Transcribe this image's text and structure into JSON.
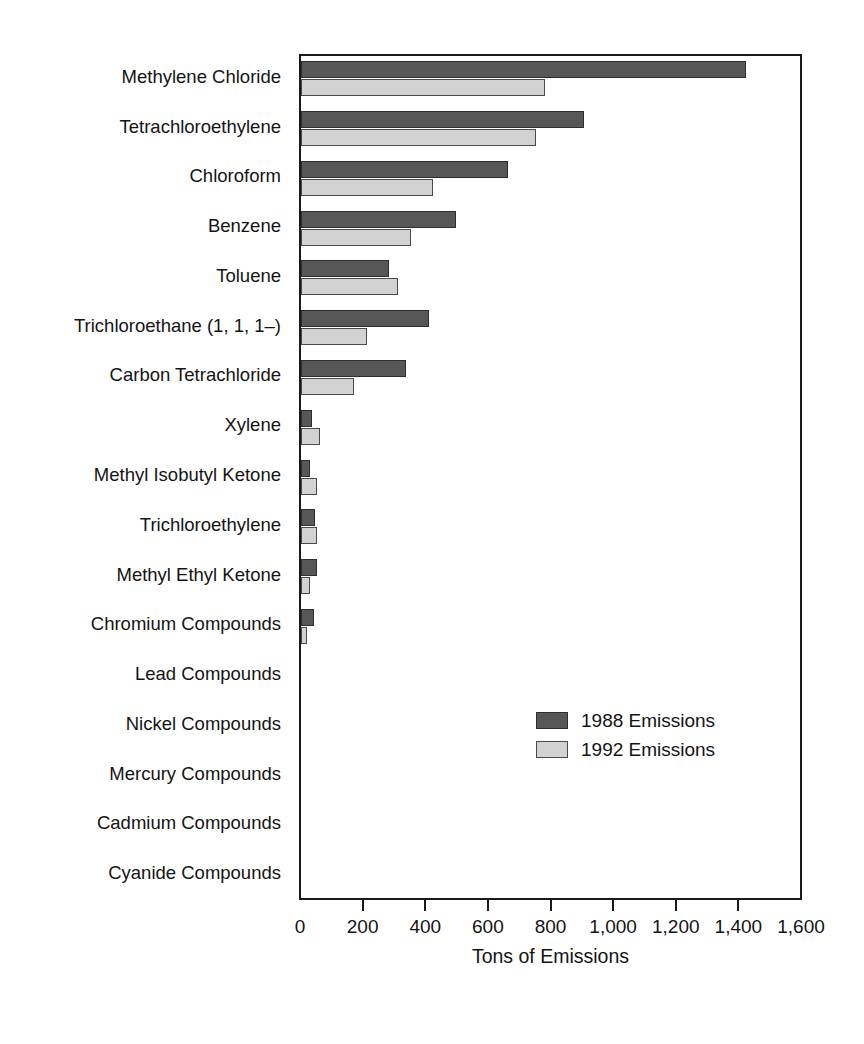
{
  "chart_data": {
    "type": "bar",
    "orientation": "horizontal",
    "title": "",
    "xlabel": "Tons of Emissions",
    "ylabel": "",
    "xlim": [
      0,
      1600
    ],
    "xticks": [
      0,
      200,
      400,
      600,
      800,
      1000,
      1200,
      1400,
      1600
    ],
    "xticklabels": [
      "0",
      "200",
      "400",
      "600",
      "800",
      "1,000",
      "1,200",
      "1,400",
      "1,600"
    ],
    "grid": false,
    "legend_position": "inside-lower-right",
    "categories": [
      "Methylene Chloride",
      "Tetrachloroethylene",
      "Chloroform",
      "Benzene",
      "Toluene",
      "Trichloroethane (1, 1, 1–)",
      "Carbon Tetrachloride",
      "Xylene",
      "Methyl Isobutyl Ketone",
      "Trichloroethylene",
      "Methyl Ethyl Ketone",
      "Chromium Compounds",
      "Lead Compounds",
      "Nickel Compounds",
      "Mercury Compounds",
      "Cadmium Compounds",
      "Cyanide Compounds"
    ],
    "series": [
      {
        "name": "1988 Emissions",
        "color": "#575757",
        "values": [
          1420,
          905,
          660,
          495,
          280,
          410,
          335,
          35,
          30,
          45,
          50,
          40,
          0,
          0,
          0,
          0,
          0
        ]
      },
      {
        "name": "1992 Emissions",
        "color": "#d2d2d2",
        "values": [
          780,
          750,
          420,
          350,
          310,
          210,
          170,
          60,
          50,
          50,
          30,
          18,
          0,
          0,
          0,
          0,
          0
        ]
      }
    ]
  },
  "legend": {
    "entries": [
      {
        "label": "1988 Emissions"
      },
      {
        "label": "1992 Emissions"
      }
    ]
  }
}
